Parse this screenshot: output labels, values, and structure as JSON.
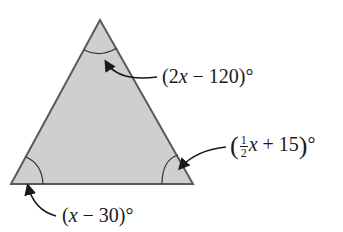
{
  "diagram": {
    "type": "triangle-angles",
    "colors": {
      "fill": "#cfcfcf",
      "stroke": "#555555",
      "text": "#1a1a1a"
    },
    "vertices": {
      "top": [
        100,
        20
      ],
      "bottom_left": [
        11,
        184
      ],
      "bottom_right": [
        193,
        184
      ]
    },
    "angles": {
      "top": {
        "pre": "(2",
        "var": "x",
        "post": " − 120)°"
      },
      "bottom_right": {
        "open": "(",
        "frac_num": "1",
        "frac_den": "2",
        "var": "x",
        "post": " + 15",
        "close": ")",
        "deg": "°"
      },
      "bottom_left": {
        "pre": "(",
        "var": "x",
        "post": " − 30)°"
      }
    }
  }
}
